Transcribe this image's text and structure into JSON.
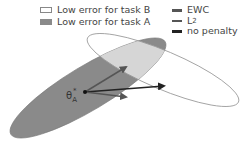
{
  "legend": {
    "regions": [
      {
        "label": "Low error for task B",
        "fill": "#ffffff",
        "stroke": "#888888"
      },
      {
        "label": "Low error for task A",
        "fill": "#8a8a8a"
      }
    ],
    "methods": [
      {
        "label": "EWC",
        "color": "#555555"
      },
      {
        "label": "L",
        "subscript": "2",
        "color": "#555555"
      },
      {
        "label": "no penalty",
        "color": "#222222"
      }
    ]
  },
  "diagram": {
    "start_point_label": "θ",
    "start_point_subscript": "A",
    "start_point_superscript": "*",
    "arrows": [
      {
        "method": "EWC",
        "to": [
          128,
          66
        ]
      },
      {
        "method": "no penalty",
        "to": [
          166,
          86
        ]
      },
      {
        "method": "L2",
        "to": [
          128,
          98
        ]
      }
    ],
    "colors": {
      "task_a_fill": "#8a8a8a",
      "overlap_fill": "#d6d6d6",
      "task_b_stroke": "#999999"
    }
  }
}
